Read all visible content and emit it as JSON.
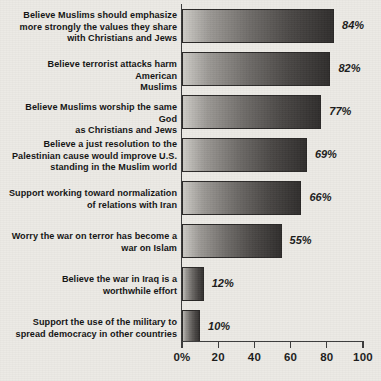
{
  "chart_data": {
    "type": "bar",
    "orientation": "horizontal",
    "title": "",
    "subtitle": "",
    "xlabel": "",
    "ylabel": "",
    "xlim": [
      0,
      100
    ],
    "grid": false,
    "legend": null,
    "value_suffix": "%",
    "axis_ticks": [
      {
        "value": 0,
        "label": "0%"
      },
      {
        "value": 20,
        "label": "20"
      },
      {
        "value": 40,
        "label": "40"
      },
      {
        "value": 60,
        "label": "60"
      },
      {
        "value": 80,
        "label": "80"
      },
      {
        "value": 100,
        "label": "100"
      }
    ],
    "categories": [
      "Believe Muslims should emphasize more strongly the values they share with Christians and Jews",
      "Believe terrorist attacks harm American Muslims",
      "Believe Muslims worship the same God as Christians and Jews",
      "Believe a just resolution to the Palestinian cause would improve U.S. standing in the Muslim world",
      "Support working toward normalization of relations with Iran",
      "Worry the war on terror has become a war on Islam",
      "Believe the war in Iraq is a worthwhile effort",
      "Support the use of the military to spread democracy in other countries"
    ],
    "values": [
      84,
      82,
      77,
      69,
      66,
      55,
      12,
      10
    ],
    "data_labels": [
      "84%",
      "82%",
      "77%",
      "69%",
      "66%",
      "55%",
      "12%",
      "10%"
    ]
  },
  "rows": [
    {
      "label_line_1": "Believe Muslims should emphasize",
      "label_line_2": "more strongly the values they share",
      "label_line_3": "with Christians and Jews",
      "value": 84,
      "value_label": "84%"
    },
    {
      "label_line_1": "Believe terrorist attacks harm American",
      "label_line_2": "Muslims",
      "label_line_3": "",
      "value": 82,
      "value_label": "82%"
    },
    {
      "label_line_1": "Believe Muslims worship the same God",
      "label_line_2": "as Christians and Jews",
      "label_line_3": "",
      "value": 77,
      "value_label": "77%"
    },
    {
      "label_line_1": "Believe a just resolution to the",
      "label_line_2": "Palestinian cause would improve U.S.",
      "label_line_3": "standing in the Muslim world",
      "value": 69,
      "value_label": "69%"
    },
    {
      "label_line_1": "Support working toward normalization",
      "label_line_2": "of relations with Iran",
      "label_line_3": "",
      "value": 66,
      "value_label": "66%"
    },
    {
      "label_line_1": "Worry the war on terror has become a",
      "label_line_2": "war on Islam",
      "label_line_3": "",
      "value": 55,
      "value_label": "55%"
    },
    {
      "label_line_1": "Believe the war in Iraq is a",
      "label_line_2": "worthwhile effort",
      "label_line_3": "",
      "value": 12,
      "value_label": "12%"
    },
    {
      "label_line_1": "Support the use of the military to",
      "label_line_2": "spread democracy in other countries",
      "label_line_3": "",
      "value": 10,
      "value_label": "10%"
    }
  ],
  "colors": {
    "background": "#eceae5",
    "axis": "#3a3a3a",
    "text": "#131313",
    "bar_light": "#cfcdc8",
    "bar_dark": "#2f2d2c"
  }
}
